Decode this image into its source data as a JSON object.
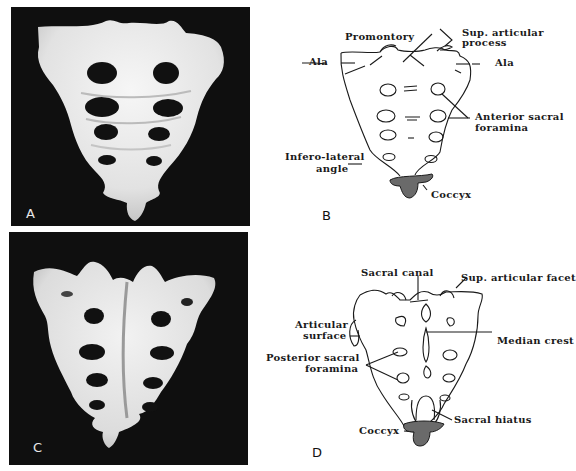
{
  "figure": {
    "panels": [
      {
        "id": "A",
        "letter": "A",
        "type": "photograph",
        "view": "anterior"
      },
      {
        "id": "B",
        "letter": "B",
        "type": "line-drawing",
        "view": "anterior"
      },
      {
        "id": "C",
        "letter": "C",
        "type": "photograph",
        "view": "posterior"
      },
      {
        "id": "D",
        "letter": "D",
        "type": "line-drawing",
        "view": "posterior"
      }
    ]
  },
  "panel_b": {
    "labels": {
      "promontory": "Promontory",
      "sup_articular_process_1": "Sup. articular",
      "sup_articular_process_2": "process",
      "ala_left": "Ala",
      "ala_right": "Ala",
      "anterior_sacral_foramina_1": "Anterior sacral",
      "anterior_sacral_foramina_2": "foramina",
      "infero_lateral_angle_1": "Infero-lateral",
      "infero_lateral_angle_2": "angle",
      "coccyx": "Coccyx"
    }
  },
  "panel_d": {
    "labels": {
      "sacral_canal": "Sacral canal",
      "sup_articular_facet": "Sup. articular facet",
      "articular_surface_1": "Articular",
      "articular_surface_2": "surface",
      "median_crest": "Median crest",
      "posterior_sacral_foramina_1": "Posterior sacral",
      "posterior_sacral_foramina_2": "foramina",
      "sacral_hiatus": "Sacral hiatus",
      "coccyx": "Coccyx"
    }
  },
  "colors": {
    "photo_background": "#0f0f0f",
    "bone": "#ececec",
    "line": "#1a1a1a",
    "coccyx_fill": "#6a6a6a"
  }
}
